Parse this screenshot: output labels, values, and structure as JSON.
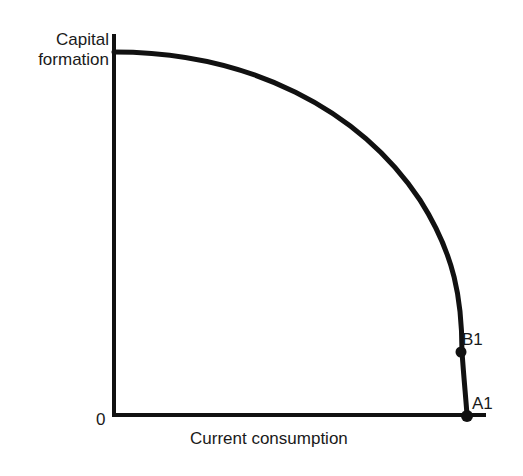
{
  "diagram": {
    "type": "production-possibility-frontier",
    "y_axis_label_line1": "Capital",
    "y_axis_label_line2": "formation",
    "x_axis_label": "Current consumption",
    "origin_label": "0",
    "points": [
      {
        "label": "B1",
        "description": "point on frontier near high consumption, low capital formation"
      },
      {
        "label": "A1",
        "description": "point on frontier at x-axis intercept (max consumption, zero capital formation)"
      }
    ],
    "line_color": "#111111"
  }
}
